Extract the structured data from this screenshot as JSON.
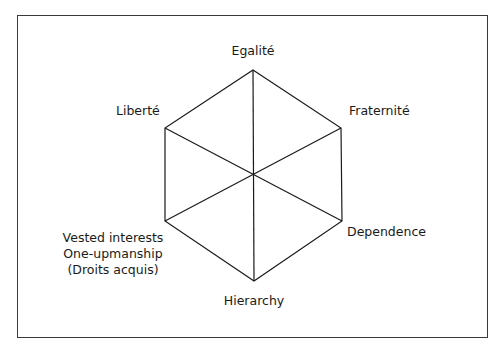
{
  "diagram": {
    "type": "hexagon",
    "labels": {
      "top": "Egalité",
      "upper_left": "Liberté",
      "upper_right": "Fraternité",
      "lower_right": "Dependence",
      "bottom": "Hierarchy",
      "lower_left": [
        "Vested interests",
        "One-upmanship",
        "(Droits acquis)"
      ]
    },
    "line_color": "#1a1a1a",
    "frame_color": "#3a3a3a"
  }
}
